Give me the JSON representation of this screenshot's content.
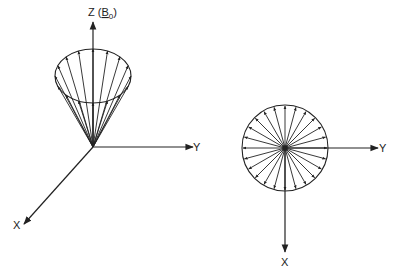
{
  "colors": {
    "ink": "#222222",
    "background": "#ffffff"
  },
  "left_panel": {
    "description": "Precessing magnetization vectors on a cone about Z (B0)",
    "axes": {
      "z_label": "Z",
      "z_paren_open": "(",
      "z_field": "B",
      "z_field_subscript": "0",
      "z_paren_close": ")",
      "y_label": "Y",
      "x_label": "X"
    },
    "origin": [
      93,
      147
    ],
    "cone_ellipse": {
      "cx": 93,
      "cy": 76,
      "rx": 38,
      "ry": 27
    },
    "vector_count": 16
  },
  "right_panel": {
    "description": "Vectors viewed along Z, fanning out in XY plane",
    "axes": {
      "y_label": "Y",
      "x_label": "X"
    },
    "circle": {
      "cx": 285,
      "cy": 148,
      "r": 43
    },
    "vector_count": 24
  }
}
